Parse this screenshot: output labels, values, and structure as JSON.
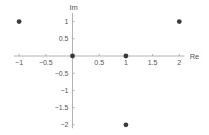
{
  "chart_data": {
    "type": "scatter",
    "title": "",
    "xlabel": "Re",
    "ylabel": "Im",
    "xlim": [
      -1.1,
      2.1
    ],
    "ylim": [
      -2.1,
      1.25
    ],
    "grid": false,
    "legend": null,
    "x_ticks": [
      -1,
      -0.5,
      0.5,
      1,
      1.5,
      2
    ],
    "x_tick_labels": [
      "-1",
      "-0.5",
      "0.5",
      "1",
      "1.5",
      "2"
    ],
    "y_ticks": [
      1,
      0.5,
      -0.5,
      -1,
      -1.5,
      -2
    ],
    "y_tick_labels": [
      "1",
      "0.5",
      "-0.5",
      "-1",
      "-1.5",
      "-2"
    ],
    "series": [
      {
        "name": "points",
        "color": "#3a3a3a",
        "points": [
          {
            "x": -1,
            "y": 1
          },
          {
            "x": 0,
            "y": 0
          },
          {
            "x": 1,
            "y": 0
          },
          {
            "x": 2,
            "y": 1
          },
          {
            "x": 1,
            "y": -2
          }
        ]
      }
    ]
  },
  "colors": {
    "axis": "#a0a0a0",
    "point": "#3a3a3a",
    "text": "#555555"
  }
}
